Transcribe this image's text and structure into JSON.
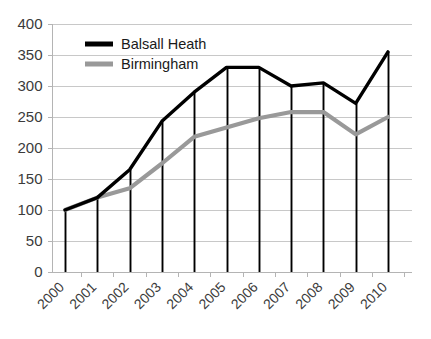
{
  "chart_data": {
    "type": "line",
    "title": "",
    "subtitle": "",
    "xlabel": "",
    "ylabel": "",
    "categories": [
      "2000",
      "2001",
      "2002",
      "2003",
      "2004",
      "2005",
      "2006",
      "2007",
      "2008",
      "2009",
      "2010"
    ],
    "series": [
      {
        "name": "Balsall Heath",
        "color": "#000000",
        "values": [
          100,
          120,
          165,
          243,
          290,
          330,
          330,
          300,
          305,
          272,
          355
        ]
      },
      {
        "name": "Birmingham",
        "color": "#999999",
        "values": [
          100,
          120,
          135,
          175,
          218,
          233,
          248,
          258,
          258,
          222,
          250
        ]
      }
    ],
    "ylim": [
      0,
      400
    ],
    "ytick_labels": [
      "0",
      "50",
      "100",
      "150",
      "200",
      "250",
      "300",
      "350",
      "400"
    ],
    "ytick_values": [
      0,
      50,
      100,
      150,
      200,
      250,
      300,
      350,
      400
    ],
    "grid": true,
    "grid_axis": "y",
    "legend_position": "top-left",
    "drop_lines": true,
    "xtick_rotation": 45
  },
  "legend": {
    "entries": [
      {
        "label": "Balsall Heath",
        "swatch_color": "#000000",
        "swatch_thickness": 5
      },
      {
        "label": "Birmingham",
        "swatch_color": "#999999",
        "swatch_thickness": 5
      }
    ]
  },
  "colors": {
    "grid": "#c8c8c8",
    "axis": "#b4b4b4",
    "tick_text": "#3b3b3b",
    "legend_text": "#1a1a1a",
    "background": "#ffffff"
  }
}
